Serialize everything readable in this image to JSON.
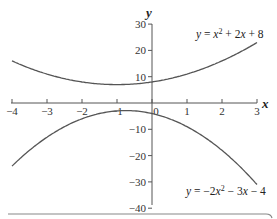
{
  "chart_data": {
    "type": "line",
    "title": "",
    "xlabel": "x",
    "ylabel": "y",
    "xlim": [
      -4,
      3
    ],
    "ylim": [
      -40,
      30
    ],
    "x_ticks": [
      -4,
      -3,
      -2,
      -1,
      0,
      1,
      2,
      3
    ],
    "x_tick_labels": [
      "−4",
      "−3",
      "−2",
      "−1",
      "0",
      "1",
      "2",
      "3"
    ],
    "y_ticks": [
      30,
      20,
      10,
      -10,
      -20,
      -30,
      -40
    ],
    "y_tick_labels": [
      "30",
      "20",
      "10",
      "−10",
      "−20",
      "−30",
      "−40"
    ],
    "grid": false,
    "series": [
      {
        "name": "y = x^2 + 2x + 8",
        "label_parts": {
          "lhs": "y",
          "eq": " = ",
          "x1": "x",
          "sup": "2",
          "mid": " + 2",
          "x2": "x",
          "tail": " + 8"
        },
        "color": "#555555",
        "x": [
          -4,
          -3,
          -2,
          -1,
          0,
          1,
          2,
          3
        ],
        "values": [
          16,
          11,
          8,
          7,
          8,
          11,
          16,
          23
        ]
      },
      {
        "name": "y = −2x^2 − 3x − 4",
        "label_parts": {
          "lhs": "y",
          "eq": " = −2",
          "x1": "x",
          "sup": "2",
          "mid": " − 3",
          "x2": "x",
          "tail": " − 4"
        },
        "color": "#555555",
        "x": [
          -4,
          -3,
          -2,
          -1,
          0,
          1,
          2,
          3
        ],
        "values": [
          -24,
          -13,
          -6,
          -3,
          -4,
          -9,
          -18,
          -31
        ]
      }
    ]
  }
}
